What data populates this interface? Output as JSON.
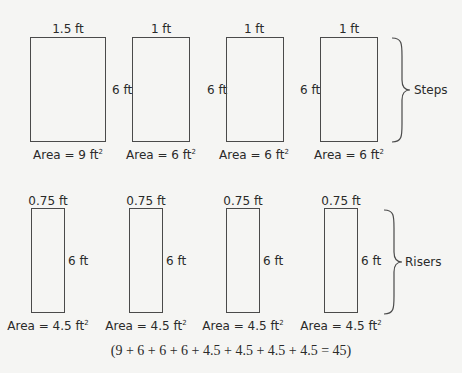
{
  "steps": {
    "group_label": "Steps",
    "items": [
      {
        "width_label": "1.5 ft",
        "height_label": "6 ft",
        "area_label": "Area = 9 ft",
        "area_unit_sup": "2"
      },
      {
        "width_label": "1 ft",
        "height_label": "6 ft",
        "area_label": "Area = 6 ft",
        "area_unit_sup": "2"
      },
      {
        "width_label": "1 ft",
        "height_label": "6 ft",
        "area_label": "Area = 6 ft",
        "area_unit_sup": "2"
      },
      {
        "width_label": "1 ft",
        "height_label": "6 ft",
        "area_label": "Area = 6 ft",
        "area_unit_sup": "2"
      }
    ]
  },
  "risers": {
    "group_label": "Risers",
    "items": [
      {
        "width_label": "0.75 ft",
        "height_label": "6 ft",
        "area_label": "Area = 4.5 ft",
        "area_unit_sup": "2"
      },
      {
        "width_label": "0.75 ft",
        "height_label": "6 ft",
        "area_label": "Area = 4.5 ft",
        "area_unit_sup": "2"
      },
      {
        "width_label": "0.75 ft",
        "height_label": "6 ft",
        "area_label": "Area = 4.5 ft",
        "area_unit_sup": "2"
      },
      {
        "width_label": "0.75 ft",
        "height_label": "6 ft",
        "area_label": "Area = 4.5 ft",
        "area_unit_sup": "2"
      }
    ]
  },
  "formula": "(9 + 6 + 6 + 6 + 4.5 + 4.5 + 4.5 + 4.5 = 45)"
}
